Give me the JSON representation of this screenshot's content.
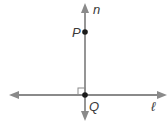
{
  "diagram": {
    "lines": [
      {
        "name": "n",
        "orientation": "vertical"
      },
      {
        "name": "ℓ",
        "orientation": "horizontal"
      }
    ],
    "points": [
      {
        "name": "P"
      },
      {
        "name": "Q"
      }
    ],
    "labels": {
      "line_n": "n",
      "line_l": "ℓ",
      "point_p": "P",
      "point_q": "Q"
    },
    "right_angle_marker": true,
    "colors": {
      "line": "#808080",
      "point": "#1a1a1a",
      "text": "#3a3a3a"
    }
  }
}
